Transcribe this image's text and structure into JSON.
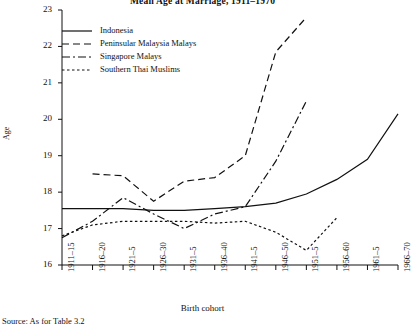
{
  "chart_data": {
    "type": "line",
    "title": "Mean Age at Marriage, 1911–1970",
    "xlabel": "Birth cohort",
    "ylabel": "Age",
    "ylim": [
      16,
      23
    ],
    "yticks": [
      16,
      17,
      18,
      19,
      20,
      21,
      22,
      23
    ],
    "grid": false,
    "legend_position": "top-left",
    "categories": [
      "1911–15",
      "1916–20",
      "1921–5",
      "1926–30",
      "1931–5",
      "1936–40",
      "1941–5",
      "1946–50",
      "1951–5",
      "1956–60",
      "1961–5",
      "1966–70"
    ],
    "series": [
      {
        "name": "Indonesia",
        "style": "solid",
        "values": [
          17.55,
          17.55,
          17.55,
          17.5,
          17.5,
          17.55,
          17.6,
          17.7,
          17.95,
          18.35,
          18.9,
          20.15
        ]
      },
      {
        "name": "Peninsular Malaysia Malays",
        "style": "dashed",
        "values": [
          null,
          18.5,
          18.45,
          17.75,
          18.3,
          18.4,
          19.0,
          21.85,
          22.8,
          null,
          null,
          null
        ]
      },
      {
        "name": "Singapore Malays",
        "style": "dashdot",
        "values": [
          16.75,
          17.2,
          17.85,
          17.4,
          17.0,
          17.4,
          17.6,
          18.85,
          20.5,
          null,
          null,
          null
        ]
      },
      {
        "name": "Southern Thai Muslims",
        "style": "dotted",
        "values": [
          16.8,
          17.1,
          17.2,
          17.2,
          17.2,
          17.15,
          17.2,
          16.9,
          16.4,
          17.3,
          null,
          null
        ]
      }
    ],
    "source_note": "Source: As for Table 3.2"
  }
}
